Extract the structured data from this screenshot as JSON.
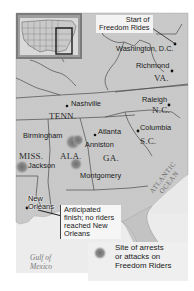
{
  "map": {
    "title_callout": "Start of Freedom Rides",
    "finish_callout": "Anticipated finish; no riders reached New Orleans",
    "cities": [
      {
        "name": "Washington, D.C.",
        "x": 177,
        "y": 44
      },
      {
        "name": "Richmond",
        "x": 173,
        "y": 70
      },
      {
        "name": "Nashville",
        "x": 67,
        "y": 104
      },
      {
        "name": "Raleigh",
        "x": 170,
        "y": 104
      },
      {
        "name": "Birmingham",
        "x": 44,
        "y": 136
      },
      {
        "name": "Atlanta",
        "x": 139,
        "y": 136
      },
      {
        "name": "Columbia",
        "x": 137,
        "y": 131
      },
      {
        "name": "Anniston",
        "x": 85,
        "y": 146
      },
      {
        "name": "Jackson",
        "x": 22,
        "y": 164
      },
      {
        "name": "Montgomery",
        "x": 80,
        "y": 174
      },
      {
        "name": "New Orleans",
        "x": 26,
        "y": 210
      }
    ],
    "states": [
      "VA.",
      "TENN.",
      "N.C.",
      "S.C.",
      "MISS.",
      "ALA.",
      "GA."
    ],
    "water_bodies": {
      "gulf": "Gulf of Mexico",
      "ocean": "ATLANTIC OCEAN"
    },
    "attack_sites": [
      "Birmingham",
      "Anniston",
      "Montgomery",
      "Jackson"
    ],
    "legend": {
      "label": "Site of arrests or attacks on Freedom Riders",
      "symbol": "gray-starburst"
    },
    "inset": {
      "description": "United States locator map with highlighted Southeast region"
    },
    "colors": {
      "land": "#c8c8c8",
      "water": "#ececec",
      "border": "#555555",
      "attack_site": "#8a8a8a",
      "callout_bg": "#f4f4f4"
    }
  },
  "labels": {
    "start_l1": "Start of",
    "start_l2": "Freedom Rides",
    "washington": "Washington, D.C.",
    "richmond": "Richmond",
    "va": "VA.",
    "nashville": "Nashville",
    "tenn": "TENN.",
    "raleigh": "Raleigh",
    "nc": "N.C.",
    "birmingham": "Birmingham",
    "atlanta": "Atlanta",
    "columbia": "Columbia",
    "anniston": "Anniston",
    "sc": "S.C.",
    "miss": "MISS.",
    "ala": "ALA.",
    "ga": "GA.",
    "jackson": "Jackson",
    "montgomery": "Montgomery",
    "new_orleans_l1": "New",
    "new_orleans_l2": "Orleans",
    "finish_l1": "Anticipated",
    "finish_l2": "finish; no riders",
    "finish_l3": "reached New",
    "finish_l4": "Orleans",
    "gulf_l1": "Gulf of",
    "gulf_l2": "Mexico",
    "ocean_l1": "ATLANTIC",
    "ocean_l2": "OCEAN",
    "legend_l1": "Site of arrests",
    "legend_l2": "or attacks on",
    "legend_l3": "Freedom Riders"
  }
}
